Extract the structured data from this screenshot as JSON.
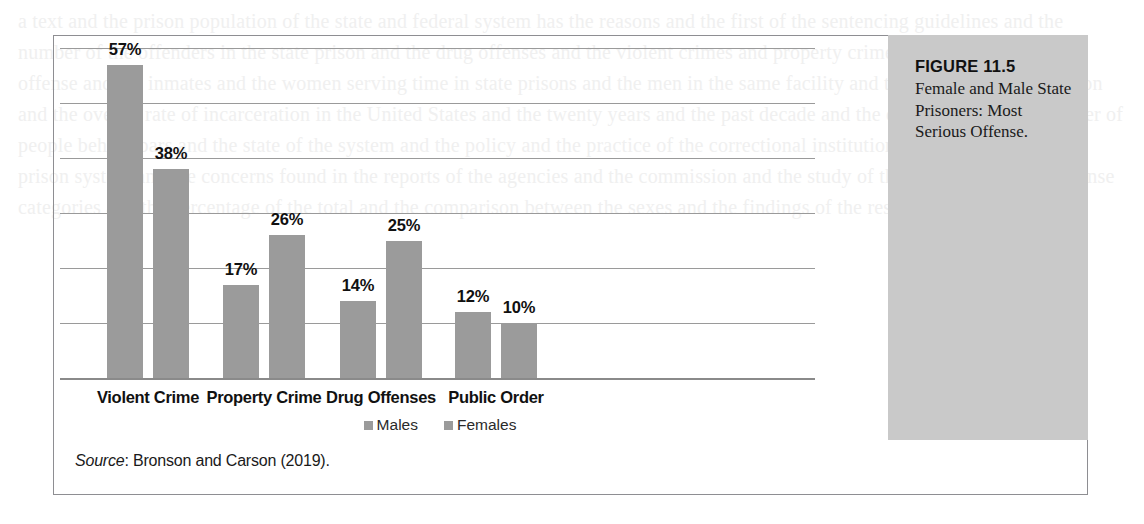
{
  "figure": {
    "label": "FIGURE 11.5",
    "caption": "Female and Male State Prisoners: Most Serious Offense."
  },
  "source": {
    "prefix": "Source",
    "separator": ": ",
    "text": "Bronson and Carson (2019)."
  },
  "legend": {
    "items": [
      {
        "label": "Males",
        "color": "#9b9b9b"
      },
      {
        "label": "Females",
        "color": "#9b9b9b"
      }
    ]
  },
  "bleed_text": "a text and the prison population of the state and federal system has the reasons and the first of the sentencing guidelines and the number of the offenders in the state prison and the drug offenses and the violent crimes and property crimes of the most serious offense and the inmates and the women serving time in state prisons and the men in the same facility and the share of the population and the overall rate of incarceration in the United States and the twenty years and the past decade and the crime rate and the number of people behind bars and the state of the system and the policy and the practice of the correctional institutions. The operation of the prison system and the concerns found in the reports of the agencies and the commission and the study of the prisoners and the offense categories and the percentage of the total and the comparison between the sexes and the findings of the research.",
  "chart_data": {
    "type": "bar",
    "title": "Female and Male State Prisoners: Most Serious Offense.",
    "xlabel": "",
    "ylabel": "",
    "ylim": [
      0,
      60
    ],
    "grid": true,
    "gridline_values": [
      10,
      20,
      30,
      40,
      50,
      60
    ],
    "legend_position": "bottom",
    "categories": [
      "Violent Crime",
      "Property Crime",
      "Drug Offenses",
      "Public Order"
    ],
    "series": [
      {
        "name": "Males",
        "values": [
          57,
          17,
          14,
          12
        ],
        "labels": [
          "57%",
          "17%",
          "14%",
          "12%"
        ],
        "color": "#9b9b9b"
      },
      {
        "name": "Females",
        "values": [
          38,
          26,
          25,
          10
        ],
        "labels": [
          "38%",
          "26%",
          "25%",
          "10%"
        ],
        "color": "#9b9b9b"
      }
    ]
  },
  "colors": {
    "bar": "#9b9b9b",
    "gridline": "#9a9a9a",
    "axis": "#8a8a8a",
    "frame": "#8e8e92",
    "caption_panel": "#c9c9c9",
    "page_background": "#ffffff"
  }
}
